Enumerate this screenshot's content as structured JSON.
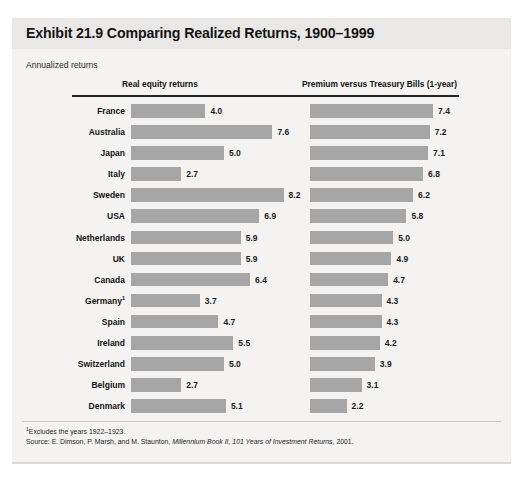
{
  "exhibit": {
    "title": "Exhibit 21.9 Comparing Realized Returns, 1900–1999",
    "subtitle": "Annualized returns",
    "footnote_marker": "1",
    "footnote": "Excludes the years 1922–1923.",
    "source_prefix": "Source: E. Dimson, P. Marsh, and M. Staunton, ",
    "source_italic": "Millennium Book II, 101 Years of Investment Returns",
    "source_suffix": ", 2001.",
    "bar_color": "#a6a6a6",
    "title_band_color": "#e9e8e6",
    "panel_color": "#f4f3f1",
    "rule_color": "#262626"
  },
  "chart_data": {
    "type": "bar",
    "title": "Exhibit 21.9 Comparing Realized Returns, 1900–1999",
    "subtitle": "Annualized returns",
    "orientation": "horizontal",
    "grid": false,
    "legend": "none",
    "xlabel": "",
    "ylabel": "",
    "xlim": [
      0,
      8.6
    ],
    "categories": [
      "France",
      "Australia",
      "Japan",
      "Italy",
      "Sweden",
      "USA",
      "Netherlands",
      "UK",
      "Canada",
      "Germany",
      "Spain",
      "Ireland",
      "Switzerland",
      "Belgium",
      "Denmark"
    ],
    "category_footnotes": {
      "Germany": "1"
    },
    "series": [
      {
        "name": "Real equity returns",
        "values": [
          4.0,
          7.6,
          5.0,
          2.7,
          8.2,
          6.9,
          5.9,
          5.9,
          6.4,
          3.7,
          4.7,
          5.5,
          5.0,
          2.7,
          5.1
        ]
      },
      {
        "name": "Premium versus Treasury Bills (1-year)",
        "values": [
          7.4,
          7.2,
          7.1,
          6.8,
          6.2,
          5.8,
          5.0,
          4.9,
          4.7,
          4.3,
          4.3,
          4.2,
          3.9,
          3.1,
          2.2
        ]
      }
    ],
    "value_labels": {
      "Real equity returns": [
        "4.0",
        "7.6",
        "5.0",
        "2.7",
        "8.2",
        "6.9",
        "5.9",
        "5.9",
        "6.4",
        "3.7",
        "4.7",
        "5.5",
        "5.0",
        "2.7",
        "5.1"
      ],
      "Premium versus Treasury Bills (1-year)": [
        "7.4",
        "7.2",
        "7.1",
        "6.8",
        "6.2",
        "5.8",
        "5.0",
        "4.9",
        "4.7",
        "4.3",
        "4.3",
        "4.2",
        "3.9",
        "3.1",
        "2.2"
      ]
    }
  }
}
